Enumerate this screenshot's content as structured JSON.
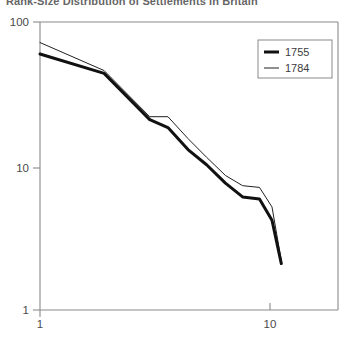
{
  "title": "Rank-Size Distribution of Settlements in Britain",
  "chart_data": {
    "type": "line",
    "title": "Rank-Size Distribution of Settlements in Britain",
    "xlabel": "",
    "ylabel": "",
    "xscale": "log",
    "yscale": "log",
    "xlim": [
      1,
      14
    ],
    "ylim": [
      1,
      100
    ],
    "grid": false,
    "legend_position": "top-right",
    "xticks": [
      1,
      10
    ],
    "xticklabels": [
      "1",
      "10"
    ],
    "yticks": [
      1,
      10,
      100
    ],
    "yticklabels": [
      "1",
      "10",
      "100"
    ],
    "series": [
      {
        "name": "1755",
        "color": "#111111",
        "linewidth": 3,
        "x": [
          1.0,
          1.9,
          3.0,
          3.6,
          4.4,
          5.3,
          6.4,
          7.6,
          9.0,
          10.2,
          11.2
        ],
        "y": [
          60.0,
          44.0,
          21.0,
          18.5,
          13.0,
          10.2,
          7.6,
          6.1,
          5.9,
          4.2,
          2.1
        ]
      },
      {
        "name": "1784",
        "color": "#222222",
        "linewidth": 1,
        "x": [
          1.0,
          1.9,
          3.0,
          3.6,
          4.4,
          5.3,
          6.4,
          7.6,
          9.0,
          10.2,
          11.2
        ],
        "y": [
          72.0,
          46.0,
          22.0,
          22.0,
          15.5,
          11.5,
          8.6,
          7.3,
          7.1,
          5.2,
          2.2
        ]
      }
    ]
  },
  "legend": {
    "entries": [
      {
        "label": "1755",
        "style": "thick"
      },
      {
        "label": "1784",
        "style": "thin"
      }
    ]
  },
  "axes": {
    "y_top_label": "100",
    "y_mid_label": "10",
    "y_bottom_label": "1",
    "x_left_label": "1",
    "x_right_label": "10"
  }
}
